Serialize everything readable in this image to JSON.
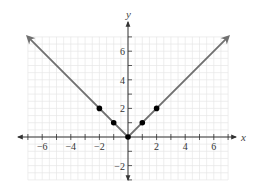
{
  "chart_data": {
    "type": "line",
    "title": "",
    "function": "y = |x|",
    "xlabel": "x",
    "ylabel": "y",
    "xlim": [
      -7,
      7
    ],
    "ylim": [
      -3,
      7
    ],
    "grid": true,
    "x_ticks": [
      -6,
      -4,
      -2,
      2,
      4,
      6
    ],
    "y_ticks": [
      -2,
      2,
      4,
      6
    ],
    "x_tick_labels": [
      "−6",
      "−4",
      "−2",
      "2",
      "4",
      "6"
    ],
    "y_tick_labels": [
      "−2",
      "2",
      "4",
      "6"
    ],
    "series": [
      {
        "name": "y = |x|",
        "line": {
          "x": [
            -7,
            0,
            7
          ],
          "y": [
            7,
            0,
            7
          ],
          "arrows_at_ends": true
        },
        "points": {
          "x": [
            -2,
            -1,
            0,
            1,
            2
          ],
          "y": [
            2,
            1,
            0,
            1,
            2
          ]
        }
      }
    ],
    "colors": {
      "line": "#707070",
      "points": "#000000",
      "axes": "#333333",
      "grid": "#e6e6e6"
    }
  },
  "labels": {
    "x_axis": "x",
    "y_axis": "y"
  }
}
